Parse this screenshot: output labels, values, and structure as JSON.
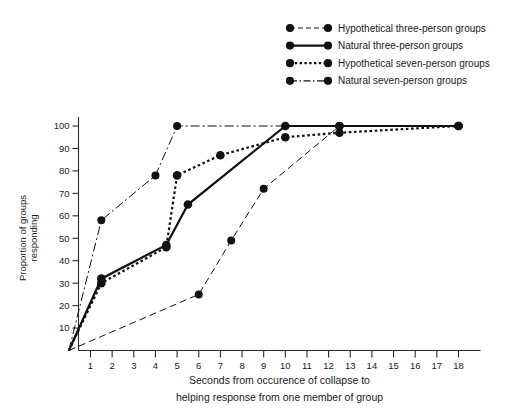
{
  "chart_data": {
    "type": "line",
    "title": "",
    "xlabel": "Seconds from occurence of collapse to helping response from one member of group",
    "xlabel_line1": "Seconds from occurence of collapse to",
    "xlabel_line2": "helping response from one member of group",
    "ylabel": "Proportion of groups responding",
    "ylabel_line1": "Proportion of groups",
    "ylabel_line2": "responding",
    "xlim": [
      0,
      18.6
    ],
    "ylim": [
      0,
      104
    ],
    "xticks": [
      1,
      2,
      3,
      4,
      5,
      6,
      7,
      8,
      9,
      10,
      11,
      12,
      13,
      14,
      15,
      16,
      17,
      18
    ],
    "yticks": [
      10,
      20,
      30,
      40,
      50,
      60,
      70,
      80,
      90,
      100
    ],
    "grid": false,
    "legend_position": "top-right",
    "series": [
      {
        "name": "Hypothetical three-person groups",
        "style": "long-dash",
        "dasharray": "7,4",
        "linewidth": 1.0,
        "points": [
          {
            "x": 0,
            "y": 0
          },
          {
            "x": 6,
            "y": 25
          },
          {
            "x": 7.5,
            "y": 49
          },
          {
            "x": 9,
            "y": 72
          },
          {
            "x": 12.5,
            "y": 100
          },
          {
            "x": 18,
            "y": 100
          }
        ]
      },
      {
        "name": "Natural three-person groups",
        "style": "solid",
        "dasharray": "none",
        "linewidth": 2.2,
        "points": [
          {
            "x": 0,
            "y": 0
          },
          {
            "x": 1.5,
            "y": 32
          },
          {
            "x": 4.5,
            "y": 47
          },
          {
            "x": 5.5,
            "y": 65
          },
          {
            "x": 10,
            "y": 100
          },
          {
            "x": 12.5,
            "y": 100
          },
          {
            "x": 18,
            "y": 100
          }
        ]
      },
      {
        "name": "Hypothetical seven-person groups",
        "style": "dotted",
        "dasharray": "2.6,2.6",
        "linewidth": 2.2,
        "points": [
          {
            "x": 0,
            "y": 0
          },
          {
            "x": 1.5,
            "y": 30
          },
          {
            "x": 4.5,
            "y": 46
          },
          {
            "x": 5,
            "y": 78
          },
          {
            "x": 7,
            "y": 87
          },
          {
            "x": 10,
            "y": 95
          },
          {
            "x": 12.5,
            "y": 97
          },
          {
            "x": 18,
            "y": 100
          }
        ]
      },
      {
        "name": "Natural seven-person groups",
        "style": "dash-dot",
        "dasharray": "9,3,2,3",
        "linewidth": 1.0,
        "points": [
          {
            "x": 0,
            "y": 0
          },
          {
            "x": 1.5,
            "y": 58
          },
          {
            "x": 4,
            "y": 78
          },
          {
            "x": 5,
            "y": 100
          },
          {
            "x": 12.5,
            "y": 100
          },
          {
            "x": 18,
            "y": 100
          }
        ]
      }
    ]
  },
  "legend": {
    "entries": [
      {
        "label": "Hypothetical three-person groups",
        "dasharray": "5,3",
        "linewidth": 1.0
      },
      {
        "label": "Natural three-person groups",
        "dasharray": "none",
        "linewidth": 2.4
      },
      {
        "label": "Hypothetical seven-person groups",
        "dasharray": "2.4,2.4",
        "linewidth": 2.2
      },
      {
        "label": "Natural seven-person groups",
        "dasharray": "7,2.5,1.5,2.5",
        "linewidth": 1.2
      }
    ]
  },
  "colors": {
    "ink": "#111111",
    "axis": "#2a2a2a",
    "background": "#ffffff"
  }
}
